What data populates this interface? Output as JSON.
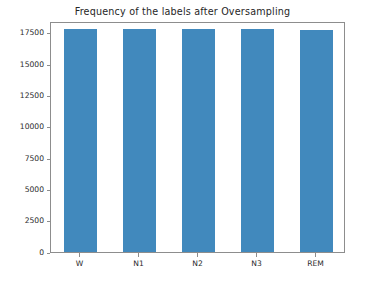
{
  "chart_data": {
    "type": "bar",
    "title": "Frequency of the labels after Oversampling",
    "xlabel": "",
    "ylabel": "",
    "categories": [
      "W",
      "N1",
      "N2",
      "N3",
      "REM"
    ],
    "values": [
      17800,
      17800,
      17790,
      17790,
      17760
    ],
    "series": [
      {
        "name": "Frequency",
        "values": [
          17800,
          17800,
          17790,
          17790,
          17760
        ],
        "color": "#4189bd"
      }
    ],
    "ylim": [
      0,
      18450
    ],
    "xlim": [
      -0.5,
      4.5
    ],
    "yticks": [
      0,
      2500,
      5000,
      7500,
      10000,
      12500,
      15000,
      17500
    ],
    "ytick_labels": [
      "0",
      "2500",
      "5000",
      "7500",
      "10000",
      "12500",
      "15000",
      "17500"
    ],
    "xtick_labels": [
      "W",
      "N1",
      "N2",
      "N3",
      "REM"
    ],
    "grid": false,
    "legend": null,
    "legend_position": "none",
    "bar_color": "#4189bd",
    "axes_edge_color": "#8d8d8d",
    "background_color": "#ffffff",
    "annotations": []
  }
}
